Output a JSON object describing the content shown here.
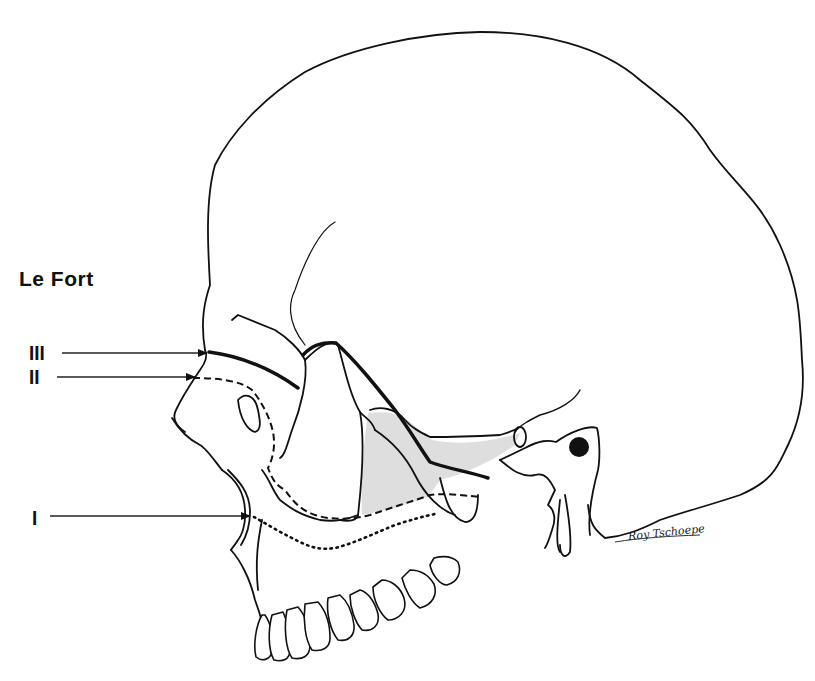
{
  "diagram": {
    "title": "Le Fort",
    "levels": [
      {
        "id": "III",
        "label": "III",
        "line_style": "solid-bold",
        "color": "#111111"
      },
      {
        "id": "II",
        "label": "II",
        "line_style": "dashed",
        "color": "#111111"
      },
      {
        "id": "I",
        "label": "I",
        "line_style": "dotted",
        "color": "#111111"
      }
    ],
    "signature": "Roy Tschoepe",
    "colors": {
      "background": "#ffffff",
      "ink": "#111111",
      "shading": "#d9d9d9"
    }
  }
}
